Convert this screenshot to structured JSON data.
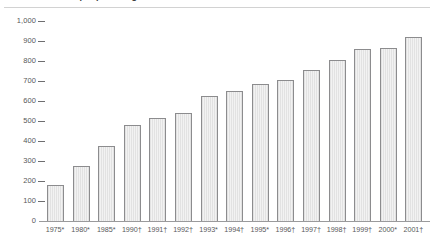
{
  "figure": {
    "title_remnant": "Number of people living with HIV/AIDS",
    "background": "#ffffff",
    "bar_fill": "#e9e9e9",
    "bar_stroke": "#8c8c8e",
    "axis_color": "#9a9a9c",
    "text_color": "#58585a"
  },
  "chart_data": {
    "type": "bar",
    "title": "",
    "xlabel": "",
    "ylabel": "",
    "ylim": [
      0,
      1000
    ],
    "ytick_step": 100,
    "ytick_labels": [
      "1,000",
      "900",
      "800",
      "700",
      "600",
      "500",
      "400",
      "300",
      "200",
      "100",
      "0"
    ],
    "ytick_values": [
      1000,
      900,
      800,
      700,
      600,
      500,
      400,
      300,
      200,
      100,
      0
    ],
    "grid": false,
    "legend": null,
    "categories": [
      "1975*",
      "1980*",
      "1985*",
      "1990†",
      "1991†",
      "1992†",
      "1993*",
      "1994†",
      "1995*",
      "1996†",
      "1997†",
      "1998†",
      "1999†",
      "2000*",
      "2001†"
    ],
    "values": [
      180,
      275,
      375,
      480,
      515,
      540,
      625,
      650,
      685,
      705,
      755,
      805,
      860,
      865,
      920
    ]
  }
}
